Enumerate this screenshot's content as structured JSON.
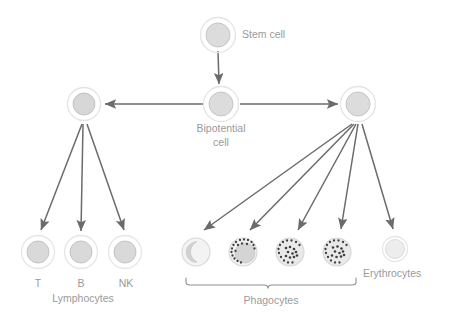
{
  "diagram": {
    "type": "flow-diagram",
    "background": "#ffffff",
    "colors": {
      "cell_fill": "#dcdcdc",
      "cell_outline": "#bdbdbd",
      "cell_ring": "#e4e4e4",
      "erythrocyte_fill": "#ececec",
      "granule": "#4a4a4a",
      "arrow": "#6b6b6b",
      "bracket": "#8f8f8f",
      "label_text": "#9a9a9a"
    },
    "labels": {
      "stem_cell": "Stem cell",
      "bipotential_line1": "Bipotential",
      "bipotential_line2": "cell",
      "t_cell": "T",
      "b_cell": "B",
      "nk_cell": "NK",
      "lymphocytes": "Lymphocytes",
      "phagocytes": "Phagocytes",
      "erythrocytes": "Erythrocytes"
    },
    "nodes": [
      {
        "id": "stem-cell",
        "label": "Stem cell",
        "x": 218,
        "y": 35,
        "r": 12,
        "style": "ringed"
      },
      {
        "id": "lymphoid-progenitor",
        "label": "",
        "x": 84,
        "y": 104,
        "r": 11,
        "style": "ringed"
      },
      {
        "id": "bipotential-cell",
        "label": "Bipotential cell",
        "x": 221,
        "y": 104,
        "r": 12,
        "style": "ringed"
      },
      {
        "id": "myeloid-progenitor",
        "label": "",
        "x": 358,
        "y": 104,
        "r": 12,
        "style": "ringed"
      },
      {
        "id": "t-lymphocyte",
        "label": "T",
        "x": 38,
        "y": 252,
        "r": 11,
        "style": "ringed"
      },
      {
        "id": "b-lymphocyte",
        "label": "B",
        "x": 81,
        "y": 252,
        "r": 11,
        "style": "ringed"
      },
      {
        "id": "nk-lymphocyte",
        "label": "NK",
        "x": 125,
        "y": 252,
        "r": 11,
        "style": "ringed"
      },
      {
        "id": "monocyte",
        "label": "",
        "x": 196,
        "y": 252,
        "r": 14,
        "style": "kidney-nucleus"
      },
      {
        "id": "granulocyte-1",
        "label": "",
        "x": 243,
        "y": 252,
        "r": 14,
        "style": "granules-perimeter"
      },
      {
        "id": "granulocyte-2",
        "label": "",
        "x": 290,
        "y": 252,
        "r": 14,
        "style": "granules-scattered"
      },
      {
        "id": "granulocyte-3",
        "label": "",
        "x": 337,
        "y": 252,
        "r": 14,
        "style": "granules-scattered"
      },
      {
        "id": "erythrocyte",
        "label": "Erythrocytes",
        "x": 395,
        "y": 249,
        "r": 11,
        "style": "pale"
      }
    ],
    "edges": [
      {
        "from": "stem-cell",
        "to": "bipotential-cell",
        "kind": "arrow-down"
      },
      {
        "from": "bipotential-cell",
        "to": "lymphoid-progenitor",
        "kind": "arrow-left"
      },
      {
        "from": "bipotential-cell",
        "to": "myeloid-progenitor",
        "kind": "arrow-right"
      },
      {
        "from": "lymphoid-progenitor",
        "to": "t-lymphocyte",
        "kind": "arrow-fan"
      },
      {
        "from": "lymphoid-progenitor",
        "to": "b-lymphocyte",
        "kind": "arrow-fan"
      },
      {
        "from": "lymphoid-progenitor",
        "to": "nk-lymphocyte",
        "kind": "arrow-fan"
      },
      {
        "from": "myeloid-progenitor",
        "to": "monocyte",
        "kind": "arrow-fan"
      },
      {
        "from": "myeloid-progenitor",
        "to": "granulocyte-1",
        "kind": "arrow-fan"
      },
      {
        "from": "myeloid-progenitor",
        "to": "granulocyte-2",
        "kind": "arrow-fan"
      },
      {
        "from": "myeloid-progenitor",
        "to": "granulocyte-3",
        "kind": "arrow-fan"
      },
      {
        "from": "myeloid-progenitor",
        "to": "erythrocyte",
        "kind": "arrow-fan"
      }
    ],
    "groups": [
      {
        "id": "lymphocytes-group",
        "label": "Lymphocytes",
        "members": [
          "t-lymphocyte",
          "b-lymphocyte",
          "nk-lymphocyte"
        ],
        "bracket": false
      },
      {
        "id": "phagocytes-group",
        "label": "Phagocytes",
        "members": [
          "monocyte",
          "granulocyte-1",
          "granulocyte-2",
          "granulocyte-3"
        ],
        "bracket": true,
        "bracket_x1": 186,
        "bracket_x2": 356,
        "bracket_y": 284
      }
    ]
  }
}
